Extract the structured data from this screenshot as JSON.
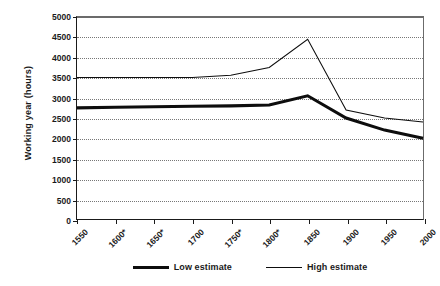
{
  "chart_data": {
    "type": "line",
    "title": "",
    "xlabel": "",
    "ylabel": "Working year (hours)",
    "ylim": [
      0,
      5000
    ],
    "ytick_step": 500,
    "grid": true,
    "legend_position": "bottom",
    "categories": [
      "1550",
      "1600*",
      "1650*",
      "1700",
      "1750*",
      "1800*",
      "1850",
      "1900",
      "1950",
      "2000"
    ],
    "yticks": [
      "0",
      "500",
      "1000",
      "1500",
      "2000",
      "2500",
      "3000",
      "3500",
      "4000",
      "4500",
      "5000"
    ],
    "series": [
      {
        "name": "Low estimate",
        "style": "thick",
        "values": [
          2750,
          2765,
          2780,
          2790,
          2800,
          2820,
          3050,
          2500,
          2200,
          2000
        ]
      },
      {
        "name": "High estimate",
        "style": "thin",
        "values": [
          3500,
          3500,
          3500,
          3500,
          3560,
          3750,
          4450,
          2700,
          2500,
          2400
        ]
      }
    ]
  },
  "legend": {
    "entries": [
      {
        "label": "Low estimate"
      },
      {
        "label": "High estimate"
      }
    ]
  },
  "colors": {
    "line": "#0d0d0d",
    "grid": "#777777",
    "axis": "#1a1a1a",
    "background": "#ffffff"
  }
}
